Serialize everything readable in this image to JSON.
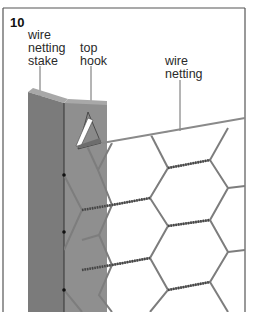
{
  "figure": {
    "number": "10",
    "labels": {
      "stake": [
        "wire",
        "netting",
        "stake"
      ],
      "hook": [
        "top",
        "hook"
      ],
      "netting": [
        "wire",
        "netting"
      ]
    }
  },
  "colors": {
    "stake_front": "#7a7a7a",
    "stake_side": "#8e8e8e",
    "stake_top": "#a6a6a6",
    "wire": "#7d7d7d",
    "border": "#555555",
    "text": "#2a2a2a"
  }
}
